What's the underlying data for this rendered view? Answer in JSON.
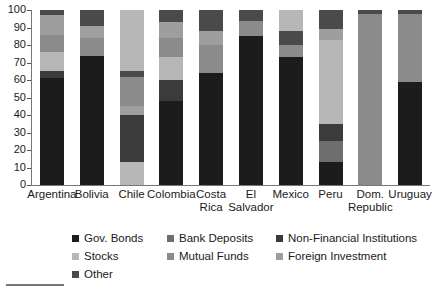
{
  "chart_data": {
    "type": "bar",
    "subtype": "stacked-100-percent",
    "title": "",
    "xlabel": "",
    "ylabel": "",
    "ylim": [
      0,
      100
    ],
    "yticks": [
      0,
      10,
      20,
      30,
      40,
      50,
      60,
      70,
      80,
      90,
      100
    ],
    "grid": false,
    "legend_position": "bottom",
    "categories": [
      "Argentina",
      "Bolivia",
      "Chile",
      "Colombia",
      "Costa Rica",
      "El Salvador",
      "Mexico",
      "Peru",
      "Dom. Republic",
      "Uruguay"
    ],
    "category_lines": [
      [
        "Argentina",
        ""
      ],
      [
        "Bolivia",
        ""
      ],
      [
        "Chile",
        ""
      ],
      [
        "Colombia",
        ""
      ],
      [
        "Costa",
        "Rica"
      ],
      [
        "El",
        "Salvador"
      ],
      [
        "Mexico",
        ""
      ],
      [
        "Peru",
        ""
      ],
      [
        "Dom.",
        "Republic"
      ],
      [
        "Uruguay",
        ""
      ]
    ],
    "series": [
      {
        "name": "Gov. Bonds",
        "color": "#1c1c1c",
        "values": [
          61,
          74,
          0,
          48,
          64,
          85,
          73,
          13,
          0,
          59
        ]
      },
      {
        "name": "Bank Deposits",
        "color": "#6e6e6e",
        "values": [
          0,
          0,
          0,
          0,
          0,
          0,
          0,
          12,
          0,
          0
        ]
      },
      {
        "name": "Non-Financial Institutions",
        "color": "#3b3b3b",
        "values": [
          4,
          0,
          13,
          12,
          0,
          0,
          0,
          10,
          0,
          0
        ]
      },
      {
        "name": "Stocks",
        "color": "#b7b7b7",
        "values": [
          11,
          0,
          24,
          13,
          0,
          0,
          0,
          48,
          98,
          0
        ]
      },
      {
        "name": "Mutual Funds",
        "color": "#8b8b8b",
        "values": [
          10,
          10,
          14,
          11,
          16,
          9,
          7,
          0,
          0,
          39
        ]
      },
      {
        "name": "Foreign Investment",
        "color": "#9e9e9e",
        "values": [
          11,
          7,
          46,
          9,
          8,
          0,
          8,
          6,
          0,
          0
        ]
      },
      {
        "name": "Other",
        "color": "#4a4a4a",
        "values": [
          3,
          9,
          3,
          7,
          12,
          6,
          12,
          11,
          2,
          2
        ]
      }
    ],
    "stack_order": [
      [
        "Gov. Bonds",
        "Non-Financial Institutions",
        "Stocks",
        "Mutual Funds",
        "Foreign Investment",
        "Other"
      ],
      [
        "Gov. Bonds",
        "Mutual Funds",
        "Foreign Investment",
        "Other"
      ],
      [
        "Gov. Bonds",
        "Non-Financial Institutions",
        "Foreign Investment",
        "Mutual Funds",
        "Stocks",
        "Other"
      ],
      [
        "Gov. Bonds",
        "Non-Financial Institutions",
        "Stocks",
        "Mutual Funds",
        "Foreign Investment",
        "Other"
      ],
      [
        "Gov. Bonds",
        "Mutual Funds",
        "Foreign Investment",
        "Other"
      ],
      [
        "Gov. Bonds",
        "Mutual Funds",
        "Other"
      ],
      [
        "Gov. Bonds",
        "Mutual Funds",
        "Foreign Investment",
        "Stocks",
        "Other"
      ],
      [
        "Gov. Bonds",
        "Bank Deposits",
        "Non-Financial Institutions",
        "Stocks",
        "Foreign Investment",
        "Other"
      ],
      [
        "Stocks",
        "Other"
      ],
      [
        "Gov. Bonds",
        "Mutual Funds",
        "Other"
      ]
    ],
    "stacks": [
      {
        "category": "Argentina",
        "segments": [
          {
            "name": "Gov. Bonds",
            "value": 61,
            "from": 0,
            "to": 61,
            "color": "#1c1c1c"
          },
          {
            "name": "Non-Financial Institutions",
            "value": 4,
            "from": 61,
            "to": 65,
            "color": "#3b3b3b"
          },
          {
            "name": "Stocks",
            "value": 11,
            "from": 65,
            "to": 76,
            "color": "#b7b7b7"
          },
          {
            "name": "Mutual Funds",
            "value": 10,
            "from": 76,
            "to": 86,
            "color": "#8b8b8b"
          },
          {
            "name": "Foreign Investment",
            "value": 11,
            "from": 86,
            "to": 97,
            "color": "#9e9e9e"
          },
          {
            "name": "Other",
            "value": 3,
            "from": 97,
            "to": 100,
            "color": "#4a4a4a"
          }
        ]
      },
      {
        "category": "Bolivia",
        "segments": [
          {
            "name": "Gov. Bonds",
            "value": 74,
            "from": 0,
            "to": 74,
            "color": "#1c1c1c"
          },
          {
            "name": "Mutual Funds",
            "value": 10,
            "from": 74,
            "to": 84,
            "color": "#8b8b8b"
          },
          {
            "name": "Foreign Investment",
            "value": 7,
            "from": 84,
            "to": 91,
            "color": "#9e9e9e"
          },
          {
            "name": "Other",
            "value": 9,
            "from": 91,
            "to": 100,
            "color": "#4a4a4a"
          }
        ]
      },
      {
        "category": "Chile",
        "segments": [
          {
            "name": "Stocks",
            "value": 13,
            "from": 0,
            "to": 13,
            "color": "#b7b7b7"
          },
          {
            "name": "Non-Financial Institutions",
            "value": 27,
            "from": 13,
            "to": 40,
            "color": "#3b3b3b"
          },
          {
            "name": "Foreign Investment",
            "value": 5,
            "from": 40,
            "to": 45,
            "color": "#9e9e9e"
          },
          {
            "name": "Mutual Funds",
            "value": 17,
            "from": 45,
            "to": 62,
            "color": "#8b8b8b"
          },
          {
            "name": "Other",
            "value": 3,
            "from": 62,
            "to": 65,
            "color": "#4a4a4a"
          },
          {
            "name": "Stocks",
            "value": 35,
            "from": 65,
            "to": 100,
            "color": "#b7b7b7"
          }
        ]
      },
      {
        "category": "Colombia",
        "segments": [
          {
            "name": "Gov. Bonds",
            "value": 48,
            "from": 0,
            "to": 48,
            "color": "#1c1c1c"
          },
          {
            "name": "Non-Financial Institutions",
            "value": 12,
            "from": 48,
            "to": 60,
            "color": "#3b3b3b"
          },
          {
            "name": "Stocks",
            "value": 13,
            "from": 60,
            "to": 73,
            "color": "#b7b7b7"
          },
          {
            "name": "Mutual Funds",
            "value": 11,
            "from": 73,
            "to": 84,
            "color": "#8b8b8b"
          },
          {
            "name": "Foreign Investment",
            "value": 9,
            "from": 84,
            "to": 93,
            "color": "#9e9e9e"
          },
          {
            "name": "Other",
            "value": 7,
            "from": 93,
            "to": 100,
            "color": "#4a4a4a"
          }
        ]
      },
      {
        "category": "Costa Rica",
        "segments": [
          {
            "name": "Gov. Bonds",
            "value": 64,
            "from": 0,
            "to": 64,
            "color": "#1c1c1c"
          },
          {
            "name": "Mutual Funds",
            "value": 16,
            "from": 64,
            "to": 80,
            "color": "#8b8b8b"
          },
          {
            "name": "Foreign Investment",
            "value": 8,
            "from": 80,
            "to": 88,
            "color": "#9e9e9e"
          },
          {
            "name": "Other",
            "value": 12,
            "from": 88,
            "to": 100,
            "color": "#4a4a4a"
          }
        ]
      },
      {
        "category": "El Salvador",
        "segments": [
          {
            "name": "Gov. Bonds",
            "value": 85,
            "from": 0,
            "to": 85,
            "color": "#1c1c1c"
          },
          {
            "name": "Mutual Funds",
            "value": 9,
            "from": 85,
            "to": 94,
            "color": "#8b8b8b"
          },
          {
            "name": "Other",
            "value": 6,
            "from": 94,
            "to": 100,
            "color": "#4a4a4a"
          }
        ]
      },
      {
        "category": "Mexico",
        "segments": [
          {
            "name": "Gov. Bonds",
            "value": 73,
            "from": 0,
            "to": 73,
            "color": "#1c1c1c"
          },
          {
            "name": "Mutual Funds",
            "value": 7,
            "from": 73,
            "to": 80,
            "color": "#8b8b8b"
          },
          {
            "name": "Other",
            "value": 8,
            "from": 80,
            "to": 88,
            "color": "#4a4a4a"
          },
          {
            "name": "Stocks",
            "value": 12,
            "from": 88,
            "to": 100,
            "color": "#b7b7b7"
          }
        ]
      },
      {
        "category": "Peru",
        "segments": [
          {
            "name": "Gov. Bonds",
            "value": 13,
            "from": 0,
            "to": 13,
            "color": "#1c1c1c"
          },
          {
            "name": "Bank Deposits",
            "value": 12,
            "from": 13,
            "to": 25,
            "color": "#6e6e6e"
          },
          {
            "name": "Non-Financial Institutions",
            "value": 10,
            "from": 25,
            "to": 35,
            "color": "#3b3b3b"
          },
          {
            "name": "Stocks",
            "value": 48,
            "from": 35,
            "to": 83,
            "color": "#b7b7b7"
          },
          {
            "name": "Foreign Investment",
            "value": 6,
            "from": 83,
            "to": 89,
            "color": "#9e9e9e"
          },
          {
            "name": "Other",
            "value": 11,
            "from": 89,
            "to": 100,
            "color": "#4a4a4a"
          }
        ]
      },
      {
        "category": "Dom. Republic",
        "segments": [
          {
            "name": "Stocks",
            "value": 98,
            "from": 0,
            "to": 98,
            "color": "#8b8b8b"
          },
          {
            "name": "Other",
            "value": 2,
            "from": 98,
            "to": 100,
            "color": "#4a4a4a"
          }
        ]
      },
      {
        "category": "Uruguay",
        "segments": [
          {
            "name": "Gov. Bonds",
            "value": 59,
            "from": 0,
            "to": 59,
            "color": "#1c1c1c"
          },
          {
            "name": "Mutual Funds",
            "value": 39,
            "from": 59,
            "to": 98,
            "color": "#8b8b8b"
          },
          {
            "name": "Other",
            "value": 2,
            "from": 98,
            "to": 100,
            "color": "#4a4a4a"
          }
        ]
      }
    ],
    "legend": [
      {
        "label": "Gov. Bonds",
        "color": "#1c1c1c",
        "col": 0,
        "row": 0
      },
      {
        "label": "Bank Deposits",
        "color": "#6e6e6e",
        "col": 1,
        "row": 0
      },
      {
        "label": "Non-Financial Institutions",
        "color": "#3b3b3b",
        "col": 2,
        "row": 0
      },
      {
        "label": "Stocks",
        "color": "#b7b7b7",
        "col": 0,
        "row": 1
      },
      {
        "label": "Mutual Funds",
        "color": "#8b8b8b",
        "col": 1,
        "row": 1
      },
      {
        "label": "Foreign Investment",
        "color": "#9e9e9e",
        "col": 2,
        "row": 1
      },
      {
        "label": "Other",
        "color": "#4a4a4a",
        "col": 0,
        "row": 2
      }
    ]
  },
  "caption": {
    "text": ""
  }
}
